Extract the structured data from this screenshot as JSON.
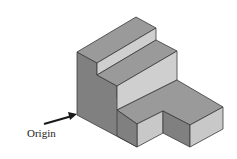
{
  "figure": {
    "type": "isometric-staircase-solid",
    "annotation": {
      "label": "Origin"
    },
    "colors": {
      "top": "#9a9a9a",
      "left": "#7d7d7d",
      "front": "#c8c8c8",
      "edge": "#3a3a3a",
      "arrow": "#1a1a1a"
    }
  }
}
